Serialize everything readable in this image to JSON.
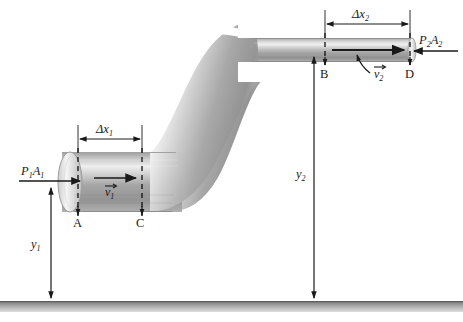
{
  "figure": {
    "background_color": "#ffffff",
    "ink_color": "#1a1a1a",
    "pipe_light": "#f2f2f2",
    "pipe_mid": "#b5b5b5",
    "pipe_dark": "#8a8a8a",
    "ground_color": "#9a9a9a"
  },
  "labels": {
    "force_in": {
      "text": "P",
      "sub": "1",
      "text2": "A",
      "sub2": "1",
      "full": "P1A1"
    },
    "force_out": {
      "text": "P",
      "sub": "2",
      "text2": "A",
      "sub2": "2",
      "full": "P2A2"
    },
    "velocity_in": {
      "text": "v",
      "sub": "1",
      "full": "v1"
    },
    "velocity_out": {
      "text": "v",
      "sub": "2",
      "full": "v2"
    },
    "dx1": {
      "delta": "Δ",
      "text": "x",
      "sub": "1",
      "full": "Δx1"
    },
    "dx2": {
      "delta": "Δ",
      "text": "x",
      "sub": "2",
      "full": "Δx2"
    },
    "y1": {
      "text": "y",
      "sub": "1",
      "full": "y1"
    },
    "y2": {
      "text": "y",
      "sub": "2",
      "full": "y2"
    },
    "point_a": "A",
    "point_b": "B",
    "point_c": "C",
    "point_d": "D"
  },
  "geometry": {
    "lower_pipe": {
      "x_left": 60,
      "x_right": 175,
      "y_top": 152,
      "y_bottom": 212,
      "axis_y": 182
    },
    "upper_pipe": {
      "x_left": 300,
      "x_right": 413,
      "y_top": 38,
      "y_bottom": 62,
      "axis_y": 50
    },
    "ground_line_y": 303,
    "dx1_span": {
      "x1": 78,
      "x2": 142,
      "y": 139
    },
    "dx2_span": {
      "x1": 325,
      "x2": 410,
      "y": 22
    },
    "y1_arrow": {
      "x": 51,
      "y_top": 183,
      "y_bottom": 303
    },
    "y2_arrow": {
      "x": 314,
      "y_top": 57,
      "y_bottom": 303
    }
  }
}
